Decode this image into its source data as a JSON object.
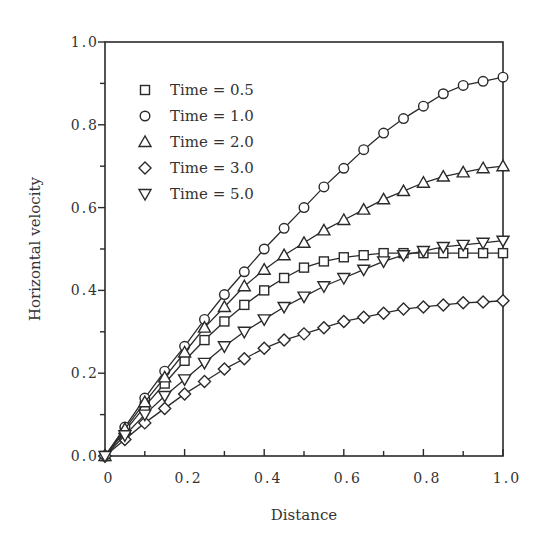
{
  "chart_data": {
    "type": "line",
    "title": "",
    "xlabel": "Distance",
    "ylabel": "Horizontal velocity",
    "xlim": [
      0,
      1.0
    ],
    "ylim": [
      0,
      1.0
    ],
    "xticks": [
      "0",
      "0.2",
      "0.4",
      "0.6",
      "0.8",
      "1.0"
    ],
    "yticks": [
      "0.0",
      "0.2",
      "0.4",
      "0.6",
      "0.8",
      "1.0"
    ],
    "grid": false,
    "legend_position": "upper left",
    "x": [
      0,
      0.05,
      0.1,
      0.15,
      0.2,
      0.25,
      0.3,
      0.35,
      0.4,
      0.45,
      0.5,
      0.55,
      0.6,
      0.65,
      0.7,
      0.75,
      0.8,
      0.85,
      0.9,
      0.95,
      1.0
    ],
    "series": [
      {
        "name": "Time = 0.5",
        "marker": "square",
        "values": [
          0,
          0.06,
          0.12,
          0.175,
          0.23,
          0.28,
          0.325,
          0.365,
          0.4,
          0.43,
          0.455,
          0.47,
          0.48,
          0.485,
          0.49,
          0.49,
          0.49,
          0.49,
          0.49,
          0.49,
          0.49
        ]
      },
      {
        "name": "Time = 1.0",
        "marker": "circle",
        "values": [
          0,
          0.07,
          0.14,
          0.205,
          0.265,
          0.33,
          0.39,
          0.445,
          0.5,
          0.55,
          0.6,
          0.65,
          0.695,
          0.74,
          0.78,
          0.815,
          0.845,
          0.875,
          0.895,
          0.905,
          0.915
        ]
      },
      {
        "name": "Time = 2.0",
        "marker": "triangle-up",
        "values": [
          0,
          0.065,
          0.13,
          0.19,
          0.25,
          0.31,
          0.36,
          0.41,
          0.45,
          0.485,
          0.515,
          0.545,
          0.57,
          0.595,
          0.62,
          0.64,
          0.66,
          0.675,
          0.685,
          0.695,
          0.7
        ]
      },
      {
        "name": "Time = 3.0",
        "marker": "diamond",
        "values": [
          0,
          0.04,
          0.08,
          0.115,
          0.15,
          0.18,
          0.21,
          0.235,
          0.26,
          0.28,
          0.295,
          0.31,
          0.325,
          0.335,
          0.345,
          0.355,
          0.36,
          0.365,
          0.37,
          0.372,
          0.375
        ]
      },
      {
        "name": "Time = 5.0",
        "marker": "triangle-down",
        "values": [
          0,
          0.05,
          0.1,
          0.145,
          0.185,
          0.225,
          0.265,
          0.3,
          0.33,
          0.36,
          0.385,
          0.41,
          0.43,
          0.45,
          0.47,
          0.485,
          0.495,
          0.505,
          0.51,
          0.515,
          0.52
        ]
      }
    ]
  }
}
